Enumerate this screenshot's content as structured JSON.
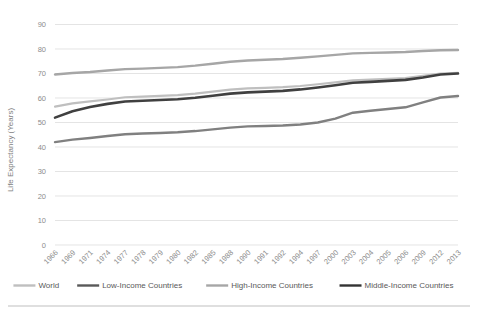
{
  "chart_data": {
    "type": "line",
    "title": "",
    "xlabel": "",
    "ylabel": "Life Expectancy (Years)",
    "ylim": [
      0,
      90
    ],
    "ytick_step": 10,
    "yticks": [
      "0",
      "10",
      "20",
      "30",
      "40",
      "50",
      "60",
      "70",
      "80",
      "90"
    ],
    "grid": true,
    "legend_position": "bottom",
    "categories": [
      "1966",
      "1969",
      "1971",
      "1974",
      "1977",
      "1978",
      "1979",
      "1980",
      "1982",
      "1985",
      "1988",
      "1990",
      "1991",
      "1992",
      "1994",
      "1997",
      "2000",
      "2003",
      "2004",
      "2005",
      "2006",
      "2009",
      "2012",
      "2013"
    ],
    "series": [
      {
        "name": "World",
        "color": "#bfbfbf",
        "width": 2.2,
        "values": [
          56.5,
          57.8,
          58.6,
          59.4,
          60.3,
          60.6,
          60.9,
          61.2,
          61.8,
          62.6,
          63.4,
          63.9,
          64.1,
          64.4,
          64.9,
          65.6,
          66.4,
          67.2,
          67.5,
          67.8,
          68.1,
          69.0,
          70.0,
          70.3
        ]
      },
      {
        "name": "Low-Income Countries",
        "color": "#808080",
        "width": 2.4,
        "values": [
          42.0,
          43.0,
          43.7,
          44.5,
          45.2,
          45.5,
          45.7,
          46.0,
          46.5,
          47.2,
          47.9,
          48.4,
          48.6,
          48.8,
          49.2,
          50.0,
          51.6,
          54.0,
          54.8,
          55.5,
          56.2,
          58.2,
          60.2,
          60.8
        ]
      },
      {
        "name": "High-Income Countries",
        "color": "#a6a6a6",
        "width": 2.4,
        "values": [
          69.6,
          70.2,
          70.6,
          71.2,
          71.8,
          72.0,
          72.3,
          72.6,
          73.2,
          74.0,
          74.8,
          75.3,
          75.6,
          75.9,
          76.4,
          77.0,
          77.6,
          78.2,
          78.4,
          78.6,
          78.8,
          79.2,
          79.5,
          79.6
        ]
      },
      {
        "name": "Middle-Income Countries",
        "color": "#404040",
        "width": 2.6,
        "values": [
          52.0,
          54.6,
          56.3,
          57.6,
          58.6,
          58.9,
          59.2,
          59.5,
          60.1,
          60.9,
          61.8,
          62.3,
          62.6,
          62.9,
          63.5,
          64.3,
          65.2,
          66.2,
          66.6,
          67.0,
          67.4,
          68.4,
          69.6,
          70.0
        ]
      }
    ]
  },
  "legend": {
    "items": [
      {
        "label": "World",
        "color": "#bfbfbf"
      },
      {
        "label": "Low-Income Countries",
        "color": "#595959"
      },
      {
        "label": "High-Income Countries",
        "color": "#a6a6a6"
      },
      {
        "label": "Middle-Income Countries",
        "color": "#333333"
      }
    ]
  }
}
